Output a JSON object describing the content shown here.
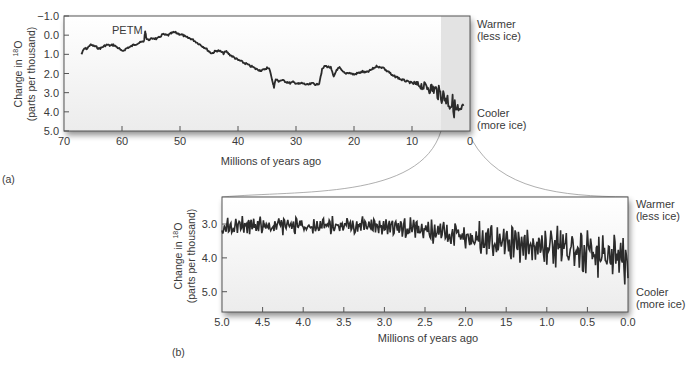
{
  "chart_data": [
    {
      "id": "a",
      "panel_label": "(a)",
      "type": "line",
      "title": "",
      "xlabel": "Millions of years ago",
      "ylabel_line1": "Change in ",
      "ylabel_sup": "18",
      "ylabel_after_sup": "O",
      "ylabel_line2": "(parts per thousand)",
      "xlim": [
        70,
        0
      ],
      "ylim": [
        -1.0,
        5.0
      ],
      "y_inverted": true,
      "x_ticks": [
        "70",
        "60",
        "50",
        "40",
        "30",
        "20",
        "10",
        "0"
      ],
      "y_ticks": [
        "−1.0",
        "0.0",
        "1.0",
        "2.0",
        "3.0",
        "4.0",
        "5.0"
      ],
      "annotation": "PETM",
      "right_labels": {
        "top_line1": "Warmer",
        "top_line2": "(less ice)",
        "bottom_line1": "Cooler",
        "bottom_line2": "(more ice)"
      },
      "highlight_region_x": [
        5,
        0
      ],
      "series": [
        {
          "name": "delta18O",
          "x": [
            67,
            66.5,
            66,
            65.5,
            65,
            64.5,
            64,
            63.5,
            63,
            62.5,
            62,
            61.5,
            61,
            60.5,
            60,
            59.5,
            59,
            58.5,
            58,
            57.5,
            57,
            56.5,
            56.2,
            56,
            55.8,
            55.5,
            55,
            54.5,
            54,
            53.5,
            53,
            52.5,
            52,
            51.5,
            51,
            50.5,
            50,
            49.5,
            49,
            48.5,
            48,
            47.5,
            47,
            46.5,
            46,
            45.5,
            45,
            44.5,
            44,
            43.5,
            43,
            42.5,
            42,
            41.5,
            41,
            40.5,
            40,
            39.5,
            39,
            38.5,
            38,
            37.5,
            37,
            36.5,
            36,
            35.5,
            35,
            34.5,
            34,
            33.8,
            33.5,
            33,
            32.5,
            32,
            31.5,
            31,
            30.5,
            30,
            29.5,
            29,
            28.5,
            28,
            27.5,
            27,
            26.5,
            26,
            25.5,
            25,
            24.5,
            24,
            23.5,
            23,
            22.5,
            22,
            21.5,
            21,
            20.5,
            20,
            19.5,
            19,
            18.5,
            18,
            17.5,
            17,
            16.5,
            16,
            15.5,
            15,
            14.5,
            14,
            13.5,
            13,
            12.5,
            12,
            11.5,
            11,
            10.5,
            10,
            9.5,
            9,
            8.5,
            8,
            7.5,
            7,
            6.5,
            6,
            5.5,
            5,
            4.5,
            4,
            3.5,
            3,
            2.5,
            2,
            1.5,
            1,
            0.5,
            0
          ],
          "y": [
            1.0,
            0.7,
            0.7,
            0.5,
            0.55,
            0.6,
            0.7,
            0.65,
            0.55,
            0.5,
            0.55,
            0.5,
            0.6,
            0.7,
            0.85,
            0.75,
            0.65,
            0.6,
            0.5,
            0.45,
            0.4,
            0.35,
            0.3,
            -0.2,
            0.15,
            0.25,
            0.2,
            0.15,
            0.2,
            0.1,
            -0.05,
            0.0,
            0.0,
            -0.1,
            -0.15,
            -0.1,
            -0.05,
            0.0,
            0.1,
            0.15,
            0.2,
            0.3,
            0.4,
            0.5,
            0.6,
            0.7,
            0.85,
            0.95,
            0.85,
            0.8,
            0.85,
            0.95,
            0.85,
            1.0,
            1.1,
            1.2,
            1.3,
            1.35,
            1.45,
            1.5,
            1.6,
            1.65,
            1.75,
            1.8,
            1.85,
            1.8,
            1.7,
            1.8,
            2.5,
            2.7,
            2.3,
            2.4,
            2.35,
            2.4,
            2.45,
            2.5,
            2.45,
            2.5,
            2.55,
            2.5,
            2.55,
            2.6,
            2.55,
            2.5,
            2.6,
            2.5,
            1.8,
            1.6,
            1.65,
            1.7,
            2.2,
            1.8,
            1.7,
            1.9,
            2.0,
            1.95,
            2.0,
            2.05,
            2.0,
            1.95,
            1.9,
            1.95,
            1.9,
            1.8,
            1.7,
            1.6,
            1.7,
            1.65,
            1.85,
            1.9,
            2.1,
            2.15,
            2.2,
            2.3,
            2.35,
            2.4,
            2.45,
            2.5,
            2.55,
            2.6,
            2.6,
            2.7,
            2.65,
            2.75,
            2.8,
            2.85,
            3.0,
            3.1,
            3.2,
            3.3,
            3.5,
            3.6,
            3.9,
            4.1,
            4.3,
            3.5
          ]
        }
      ]
    },
    {
      "id": "b",
      "panel_label": "(b)",
      "type": "line",
      "title": "",
      "xlabel": "Millions of years ago",
      "ylabel_line1": "Change in ",
      "ylabel_sup": "18",
      "ylabel_after_sup": "O",
      "ylabel_line2": "(parts per thousand)",
      "xlim": [
        5.0,
        0.0
      ],
      "ylim": [
        2.2,
        5.6
      ],
      "y_inverted": true,
      "x_ticks": [
        "5.0",
        "4.5",
        "4.0",
        "3.5",
        "3.0",
        "2.5",
        "2.0",
        "15",
        "1.0",
        "0.5",
        "0.0"
      ],
      "y_ticks": [
        "3.0",
        "4.0",
        "5.0"
      ],
      "right_labels": {
        "top_line1": "Warmer",
        "top_line2": "(less ice)",
        "bottom_line1": "Cooler",
        "bottom_line2": "(more ice)"
      },
      "series": [
        {
          "name": "delta18O",
          "x_start": 5.0,
          "x_end": 0.0,
          "trend_start": 3.05,
          "trend_plateau_until": 3.0,
          "trend_end": 4.0,
          "amplitude_start": 0.3,
          "amplitude_end": 0.85,
          "approx_points": 500
        }
      ]
    }
  ],
  "connectors": {
    "color": "#9a9a9a"
  },
  "colors": {
    "line": "#2b2b2b",
    "frame": "#555555",
    "highlight": "#e3e3e3",
    "text": "#3a3a3a"
  }
}
